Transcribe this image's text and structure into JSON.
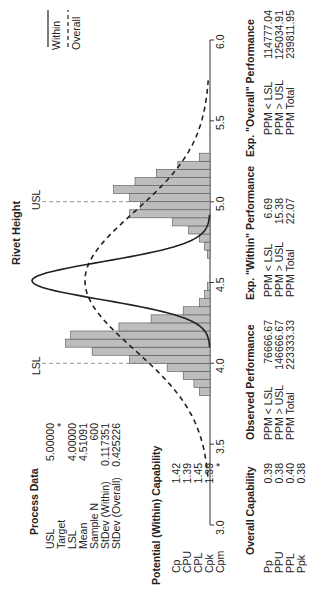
{
  "chart_data": {
    "type": "bar",
    "title": "Rivet Height",
    "xlabel": "",
    "ylabel": "",
    "xlim": [
      3.0,
      6.0
    ],
    "x_ticks": [
      "3.0",
      "3.5",
      "4.0",
      "4.5",
      "5.0",
      "5.5",
      "6.0"
    ],
    "spec_lines": {
      "LSL": 4.0,
      "USL": 5.0
    },
    "legend": [
      "Within",
      "Overall"
    ],
    "bin_width": 0.05,
    "bins_start": [
      3.8,
      3.85,
      3.9,
      3.95,
      4.0,
      4.05,
      4.1,
      4.15,
      4.2,
      4.25,
      4.3,
      4.35,
      4.4,
      4.45,
      4.65,
      4.7,
      4.75,
      4.8,
      4.85,
      4.9,
      4.95,
      5.0,
      5.05,
      5.1,
      5.15,
      5.2,
      5.25
    ],
    "values": [
      2,
      3,
      5,
      8,
      15,
      22,
      27,
      26,
      17,
      11,
      5,
      2,
      1,
      0.5,
      0.5,
      1,
      2,
      4,
      7,
      15,
      13,
      15,
      18,
      14,
      10,
      6,
      2
    ],
    "series": [
      {
        "name": "Within",
        "style": "solid",
        "mean": 4.51091,
        "stdev": 0.117351
      },
      {
        "name": "Overall",
        "style": "dashed",
        "mean": 4.51091,
        "stdev": 0.425226
      }
    ]
  },
  "title": "Rivet Height",
  "spec_labels": {
    "lsl": "LSL",
    "usl": "USL"
  },
  "legend": {
    "within": "Within",
    "overall": "Overall"
  },
  "axis_ticks": [
    "3.0",
    "3.5",
    "4.0",
    "4.5",
    "5.0",
    "5.5",
    "6.0"
  ],
  "process_data": {
    "header": "Process Data",
    "rows": [
      {
        "label": "USL",
        "value": "5.00000"
      },
      {
        "label": "Target",
        "value": "*"
      },
      {
        "label": "LSL",
        "value": "4.00000"
      },
      {
        "label": "Mean",
        "value": "4.51091"
      },
      {
        "label": "Sample N",
        "value": "600"
      },
      {
        "label": "StDev (Within)",
        "value": "0.117351"
      },
      {
        "label": "StDev (Overall)",
        "value": "0.425226"
      }
    ]
  },
  "potential": {
    "header": "Potential (Within) Capability",
    "rows": [
      {
        "label": "Cp",
        "value": "1.42"
      },
      {
        "label": "CPU",
        "value": "1.39"
      },
      {
        "label": "CPL",
        "value": "1.45"
      },
      {
        "label": "Cpk",
        "value": "1.39"
      },
      {
        "label": "Cpm",
        "value": "*"
      }
    ]
  },
  "overall": {
    "header": "Overall Capability",
    "rows": [
      {
        "label": "Pp",
        "value": "0.39"
      },
      {
        "label": "PPU",
        "value": "0.38"
      },
      {
        "label": "PPL",
        "value": "0.40"
      },
      {
        "label": "Ppk",
        "value": "0.38"
      }
    ]
  },
  "observed": {
    "header": "Observed Performance",
    "rows": [
      {
        "label": "PPM < LSL",
        "value": "76666.67"
      },
      {
        "label": "PPM > USL",
        "value": "146666.67"
      },
      {
        "label": "PPM Total",
        "value": "223333.33"
      }
    ]
  },
  "exp_within": {
    "header": "Exp. \"Within\" Performance",
    "rows": [
      {
        "label": "PPM < LSL",
        "value": "6.69"
      },
      {
        "label": "PPM > USL",
        "value": "15.38"
      },
      {
        "label": "PPM Total",
        "value": "22.07"
      }
    ]
  },
  "exp_overall": {
    "header": "Exp. \"Overall\" Performance",
    "rows": [
      {
        "label": "PPM < LSL",
        "value": "114777.04"
      },
      {
        "label": "PPM > USL",
        "value": "125034.91"
      },
      {
        "label": "PPM Total",
        "value": "239811.95"
      }
    ]
  }
}
